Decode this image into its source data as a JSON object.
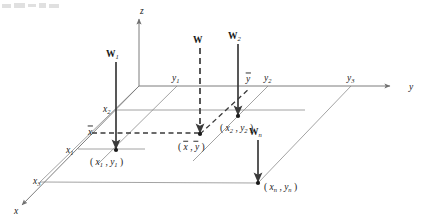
{
  "figure": {
    "kind": "3d-axis-diagram",
    "background": "#ffffff",
    "ink": "#1a1a1a",
    "grid_color": "#8c8c8c"
  },
  "axes": [
    {
      "name": "z-axis",
      "label": "z",
      "label_x": 140,
      "label_y": 14,
      "x1": 139,
      "y1": 86,
      "x2": 139,
      "y2": 19,
      "arrow": "up"
    },
    {
      "name": "y-axis",
      "label": "y",
      "label_x": 409,
      "label_y": 90,
      "x1": 139,
      "y1": 86,
      "x2": 390,
      "y2": 86,
      "arrow": "right"
    },
    {
      "name": "x-axis",
      "label": "x",
      "label_x": 14,
      "label_y": 214,
      "x1": 139,
      "y1": 86,
      "x2": 22,
      "y2": 205,
      "arrow": "down-left"
    }
  ],
  "axis_ticks": {
    "x": [
      {
        "id": "x2",
        "base": "x",
        "sub": "2",
        "tx": 103,
        "ty": 112,
        "px": 115,
        "py": 110
      },
      {
        "id": "xbar",
        "base": "x",
        "sub": "",
        "overline": true,
        "tx": 88,
        "ty": 135,
        "px": 99,
        "py": 132
      },
      {
        "id": "x1",
        "base": "x",
        "sub": "1",
        "tx": 66,
        "ty": 153,
        "px": 78,
        "py": 149
      },
      {
        "id": "x3",
        "base": "x",
        "sub": "3",
        "tx": 33,
        "ty": 184,
        "px": 44,
        "py": 181
      }
    ],
    "y": [
      {
        "id": "y1",
        "base": "y",
        "sub": "1",
        "tx": 172,
        "ty": 81,
        "px": 177,
        "py": 86
      },
      {
        "id": "ybar",
        "base": "y",
        "sub": "",
        "overline": true,
        "tx": 246,
        "ty": 82,
        "px": 250,
        "py": 86
      },
      {
        "id": "y2",
        "base": "y",
        "sub": "2",
        "tx": 264,
        "ty": 81,
        "px": 268,
        "py": 86
      },
      {
        "id": "y3",
        "base": "y",
        "sub": "3",
        "tx": 347,
        "ty": 81,
        "px": 351,
        "py": 86
      }
    ]
  },
  "forces": [
    {
      "id": "W1",
      "label": "W",
      "sub": "1",
      "style": "solid",
      "x": 116,
      "y_top": 62,
      "y_bottom": 149,
      "label_x": 106,
      "label_y": 57
    },
    {
      "id": "W",
      "label": "W",
      "sub": "",
      "style": "dashed",
      "x": 200,
      "y_top": 48,
      "y_bottom": 133,
      "label_x": 193,
      "label_y": 43
    },
    {
      "id": "W2",
      "label": "W",
      "sub": "2",
      "style": "solid",
      "x": 238,
      "y_top": 44,
      "y_bottom": 115,
      "label_x": 228,
      "label_y": 39
    },
    {
      "id": "Wn",
      "label": "W",
      "sub": "n",
      "style": "solid",
      "x": 258,
      "y_top": 140,
      "y_bottom": 182,
      "label_x": 249,
      "label_y": 135
    }
  ],
  "points": [
    {
      "id": "p1",
      "label": "( x , y )",
      "base_x": "x",
      "sub_x": "1",
      "base_y": "y",
      "sub_y": "1",
      "px": 116,
      "py": 150,
      "tx": 90,
      "ty": 165
    },
    {
      "id": "p2",
      "label": "( x , y )",
      "base_x": "x",
      "sub_x": "2",
      "base_y": "y",
      "sub_y": "2",
      "px": 238,
      "py": 116,
      "tx": 220,
      "ty": 131
    },
    {
      "id": "pbar",
      "label": "( x , y )",
      "base_x": "x",
      "sub_x": "",
      "base_y": "y",
      "sub_y": "",
      "overline": true,
      "px": 200,
      "py": 134,
      "tx": 178,
      "ty": 150
    },
    {
      "id": "pn",
      "label": "( x , y )",
      "base_x": "x",
      "sub_x": "n",
      "base_y": "y",
      "sub_y": "n",
      "px": 258,
      "py": 183,
      "tx": 264,
      "ty": 190
    }
  ],
  "plane_edges": [
    {
      "name": "edge-origin-to-x3",
      "x1": 139,
      "y1": 86,
      "x2": 40,
      "y2": 182
    },
    {
      "name": "edge-x3-bottom",
      "x1": 40,
      "y1": 182,
      "x2": 258,
      "y2": 183
    },
    {
      "name": "edge-y3-diagonal",
      "x1": 351,
      "y1": 86,
      "x2": 258,
      "y2": 183
    }
  ],
  "grid_lines": [
    {
      "name": "gridline-x2",
      "x1": 115,
      "y1": 110,
      "x2": 305,
      "y2": 110
    },
    {
      "name": "gridline-x1",
      "x1": 78,
      "y1": 149,
      "x2": 145,
      "y2": 149
    },
    {
      "name": "gridline-y1",
      "x1": 177,
      "y1": 86,
      "x2": 98,
      "y2": 164
    },
    {
      "name": "gridline-y2",
      "x1": 268,
      "y1": 86,
      "x2": 193,
      "y2": 161
    }
  ],
  "dashed_guides": [
    {
      "name": "xbar-horizontal-guide",
      "x1": 92,
      "y1": 133,
      "x2": 202,
      "y2": 133
    },
    {
      "name": "ybar-diagonal-guide",
      "x1": 200,
      "y1": 134,
      "x2": 250,
      "y2": 88
    }
  ],
  "top_artifact": {
    "name": "cropped-toolbar-fragment",
    "segments": [
      {
        "w": 9,
        "h": 4
      },
      {
        "w": 11,
        "h": 5
      },
      {
        "w": 8,
        "h": 3
      },
      {
        "w": 7,
        "h": 5
      },
      {
        "w": 10,
        "h": 4
      }
    ]
  }
}
